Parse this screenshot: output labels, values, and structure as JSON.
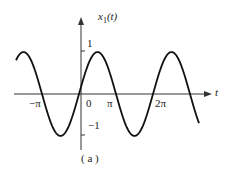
{
  "chart_data": {
    "type": "line",
    "title": "",
    "caption": "( a )",
    "xlabel": "t",
    "ylabel": "x1(t)",
    "x_tick_labels": [
      "−π",
      "0",
      "π",
      "2π"
    ],
    "y_tick_labels": [
      "1",
      "−1"
    ],
    "ylim": [
      -1,
      1
    ],
    "function": "sinusoid, amplitude 1, period ≈ 2π, slightly phase-shifted (positive at t=0)",
    "series": [
      {
        "name": "x1(t)",
        "x": [
          "≈−1.7π",
          "≈−1.2π",
          "≈−0.6π",
          "≈−0.1π",
          "≈0.4π",
          "≈0.9π",
          "≈1.4π",
          "≈1.9π",
          "≈2.4π",
          "≈2.9π",
          "≈3.2π"
        ],
        "values": [
          0.5,
          1,
          0,
          -1,
          1,
          0,
          -1,
          0,
          1,
          0,
          -0.6
        ]
      }
    ],
    "grid": false,
    "legend": "none"
  },
  "labels": {
    "ylabel_main": "x",
    "ylabel_sub": "1",
    "ylabel_arg": "(t)",
    "xlabel": "t",
    "y_one": "1",
    "y_minus_one": "−1",
    "x_minus_pi": "−π",
    "x_zero": "0",
    "x_pi": "π",
    "x_two_pi": "2π",
    "caption": "( a )"
  }
}
